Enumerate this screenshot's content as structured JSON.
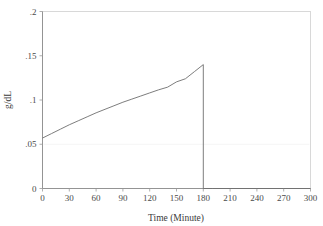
{
  "chart_data": {
    "type": "line",
    "title": "",
    "subtitle": "",
    "xlabel": "Time (Minute)",
    "ylabel": "g/dL",
    "xlim": [
      0,
      300
    ],
    "ylim": [
      0,
      0.2
    ],
    "grid": false,
    "legend": "none",
    "x_ticks": [
      0,
      30,
      60,
      90,
      120,
      150,
      180,
      210,
      240,
      270,
      300
    ],
    "x_tick_labels": [
      "0",
      "30",
      "60",
      "90",
      "120",
      "150",
      "180",
      "210",
      "240",
      "270",
      "300"
    ],
    "y_ticks": [
      0,
      0.05,
      0.1,
      0.15,
      0.2
    ],
    "y_tick_labels": [
      "0",
      ".05",
      ".1",
      ".15",
      ".2"
    ],
    "annotations": [
      "Concentration rises concavely from 0.057 g/dL at 0 minutes to a peak of 0.14 g/dL at 180 minutes, then drops vertically to 0 and remains flat through 300 minutes."
    ],
    "series": [
      {
        "name": "g/dL",
        "color": "#6e6e6e",
        "x": [
          0,
          10,
          20,
          30,
          40,
          50,
          60,
          70,
          80,
          90,
          100,
          110,
          120,
          130,
          140,
          150,
          160,
          170,
          180,
          180,
          190,
          210,
          240,
          270,
          300
        ],
        "values": [
          0.057,
          0.062,
          0.067,
          0.072,
          0.0765,
          0.081,
          0.0855,
          0.0895,
          0.0935,
          0.0975,
          0.101,
          0.1045,
          0.108,
          0.1115,
          0.1145,
          0.1205,
          0.124,
          0.132,
          0.14,
          0.0,
          0.0,
          0.0,
          0.0,
          0.0,
          0.0
        ]
      }
    ]
  },
  "figure": {
    "y_axis_title": "g/dL",
    "x_axis_title": "Time (Minute)"
  }
}
